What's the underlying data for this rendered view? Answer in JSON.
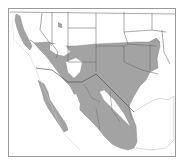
{
  "map": {
    "type": "range-map",
    "region": "Southwestern United States and Mexico",
    "colors": {
      "background": "#ffffff",
      "frame": "#9a9a9a",
      "range_fill": "#a3a3a3",
      "borders": "#6e6e6e",
      "coast": "#bdbdbd",
      "range_outline": "#8f8f8f"
    },
    "legend": [],
    "labels": []
  }
}
